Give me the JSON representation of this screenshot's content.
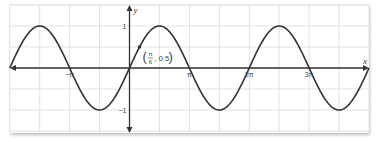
{
  "chart_data": {
    "type": "line",
    "title": "",
    "function": "y = sin(x)",
    "xlabel": "x",
    "ylabel": "y",
    "xlim": [
      -6.2832,
      12.5664
    ],
    "ylim": [
      -1.5,
      1.5
    ],
    "grid": true,
    "grid_x_step": 1.5708,
    "grid_y_step": 0.5,
    "x_ticks": [
      {
        "value": -3.1416,
        "label": "−π"
      },
      {
        "value": 3.1416,
        "label": "π"
      },
      {
        "value": 6.2832,
        "label": "2π"
      },
      {
        "value": 9.4248,
        "label": "3π"
      }
    ],
    "y_ticks": [
      {
        "value": 1,
        "label": "1"
      },
      {
        "value": -1,
        "label": "−1"
      }
    ],
    "series": [
      {
        "name": "sin x",
        "color": "#333333"
      }
    ],
    "annotations": [
      {
        "x": 0.5236,
        "y": 0.5,
        "label_num": "π",
        "label_den": "6",
        "label_y": "0.5",
        "text": "(π/6, 0.5)"
      }
    ]
  },
  "colors": {
    "curve": "#333333",
    "axis": "#333333",
    "grid": "#e2e2e2",
    "background": "#ffffff"
  }
}
